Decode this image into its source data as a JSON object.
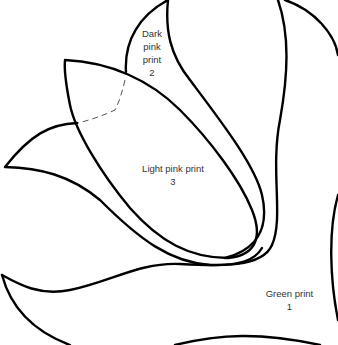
{
  "diagram": {
    "type": "applique-template",
    "line_color": "#000000",
    "background": "#ffffff",
    "pieces": [
      {
        "id": "green",
        "name_lines": [
          "Green print"
        ],
        "number": "1"
      },
      {
        "id": "dark-pink",
        "name_lines": [
          "Dark",
          "pink",
          "print"
        ],
        "number": "2"
      },
      {
        "id": "light-pink",
        "name_lines": [
          "Light pink print"
        ],
        "number": "3"
      }
    ],
    "dashed_line": "placement-guide"
  }
}
